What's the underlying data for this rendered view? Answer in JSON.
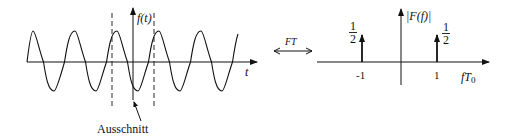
{
  "time_domain": {
    "y_axis_label": "f(t)",
    "x_axis_label": "t",
    "window_annotation": "Ausschnitt",
    "signal": "sinusoid",
    "visible_periods": 10
  },
  "transform": {
    "label": "FT",
    "symbol": "double-arrow"
  },
  "frequency_domain": {
    "y_axis_label": "|F(f)|",
    "x_axis_label_main": "fT",
    "x_axis_label_sub": "0",
    "ticks": [
      {
        "label": "-1",
        "value": -1
      },
      {
        "label": "1",
        "value": 1
      }
    ],
    "impulses": [
      {
        "position": -1,
        "weight_num": "1",
        "weight_den": "2"
      },
      {
        "position": 1,
        "weight_num": "1",
        "weight_den": "2"
      }
    ]
  },
  "colors": {
    "stroke": "#111111",
    "background": "#ffffff"
  }
}
